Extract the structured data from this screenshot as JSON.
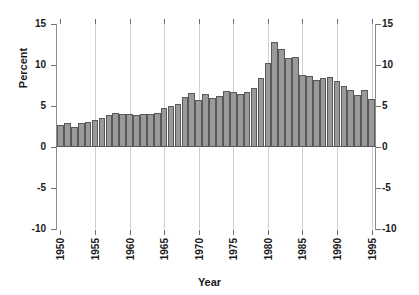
{
  "chart_data": {
    "type": "bar",
    "title": "",
    "xlabel": "Year",
    "ylabel": "Percent",
    "xlim": [
      1949.5,
      1995.5
    ],
    "ylim": [
      -10,
      15
    ],
    "ytick_values": [
      15,
      10,
      5,
      0,
      -5,
      -10
    ],
    "ytick_labels": [
      "15",
      "10",
      "5",
      "0",
      "-5",
      "-10"
    ],
    "xtick_values": [
      1950,
      1955,
      1960,
      1965,
      1970,
      1975,
      1980,
      1985,
      1990,
      1995
    ],
    "xtick_labels": [
      "1950",
      "1955",
      "1960",
      "1965",
      "1970",
      "1975",
      "1980",
      "1985",
      "1990",
      "1995"
    ],
    "grid": "vertical gridlines at x ticks",
    "legend": "none",
    "bar_color": "#9a9a9a",
    "bar_edge_color": "#595959",
    "categories": [
      1950,
      1951,
      1952,
      1953,
      1954,
      1955,
      1956,
      1957,
      1958,
      1959,
      1960,
      1961,
      1962,
      1963,
      1964,
      1965,
      1966,
      1967,
      1968,
      1969,
      1970,
      1971,
      1972,
      1973,
      1974,
      1975,
      1976,
      1977,
      1978,
      1979,
      1980,
      1981,
      1982,
      1983,
      1984,
      1985,
      1986,
      1987,
      1988,
      1989,
      1990,
      1991,
      1992,
      1993,
      1994,
      1995
    ],
    "values": [
      2.7,
      2.9,
      2.5,
      2.9,
      3.0,
      3.3,
      3.5,
      3.9,
      4.1,
      4.0,
      4.0,
      3.9,
      4.0,
      4.0,
      4.2,
      4.7,
      5.0,
      5.3,
      6.1,
      6.6,
      5.7,
      6.5,
      6.0,
      6.2,
      6.8,
      6.7,
      6.5,
      6.7,
      7.2,
      8.4,
      10.3,
      12.8,
      11.9,
      10.8,
      11.0,
      8.8,
      8.6,
      8.2,
      8.4,
      8.5,
      8.1,
      7.5,
      6.9,
      6.4,
      6.9,
      5.9
    ]
  },
  "axis": {
    "y_title": "Percent",
    "x_title": "Year"
  }
}
